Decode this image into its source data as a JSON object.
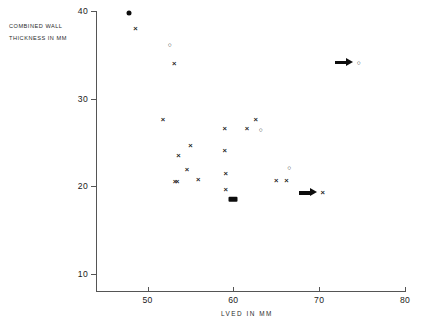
{
  "chart_data": {
    "type": "scatter",
    "title": "",
    "annotation_lines": [
      "COMBINED WALL",
      "THICKNESS IN MM"
    ],
    "xlabel": "LVED IN MM",
    "ylabel": "COMBINED WALL THICKNESS IN MM",
    "xlim": [
      44,
      80
    ],
    "ylim": [
      8,
      40
    ],
    "xticks": [
      50,
      60,
      70,
      80
    ],
    "yticks": [
      10,
      20,
      30,
      40
    ],
    "grid": false,
    "legend": null,
    "series": [
      {
        "name": "cross",
        "marker": "x",
        "points": [
          {
            "x": 48.6,
            "y": 38.0
          },
          {
            "x": 53.1,
            "y": 34.0
          },
          {
            "x": 51.8,
            "y": 27.5
          },
          {
            "x": 59.0,
            "y": 26.5
          },
          {
            "x": 62.6,
            "y": 27.6
          },
          {
            "x": 61.6,
            "y": 26.5
          },
          {
            "x": 55.0,
            "y": 24.6
          },
          {
            "x": 53.6,
            "y": 23.4
          },
          {
            "x": 59.0,
            "y": 24.0
          },
          {
            "x": 54.6,
            "y": 21.8
          },
          {
            "x": 55.9,
            "y": 20.7
          },
          {
            "x": 59.1,
            "y": 21.4
          },
          {
            "x": 65.0,
            "y": 20.6
          },
          {
            "x": 66.2,
            "y": 20.6
          },
          {
            "x": 59.1,
            "y": 19.6
          },
          {
            "x": 70.4,
            "y": 19.2
          }
        ]
      },
      {
        "name": "open-circle",
        "marker": "o",
        "points": [
          {
            "x": 52.6,
            "y": 36.1
          },
          {
            "x": 74.6,
            "y": 34.1
          },
          {
            "x": 63.2,
            "y": 26.4
          },
          {
            "x": 66.5,
            "y": 22.1
          }
        ]
      },
      {
        "name": "filled",
        "marker": "filled",
        "points": [
          {
            "x": 47.9,
            "y": 39.8
          }
        ]
      },
      {
        "name": "overlapping-pair",
        "marker": "xx",
        "points": [
          {
            "x": 53.2,
            "y": 20.5
          }
        ]
      },
      {
        "name": "filled-merged",
        "marker": "bar",
        "points": [
          {
            "x": 60.0,
            "y": 18.5
          }
        ]
      }
    ],
    "arrow_annotations": [
      {
        "x": 72.9,
        "y": 34.1,
        "direction": "right",
        "paired_marker": "o"
      },
      {
        "x": 68.7,
        "y": 19.2,
        "direction": "right",
        "paired_marker": "x"
      }
    ]
  }
}
